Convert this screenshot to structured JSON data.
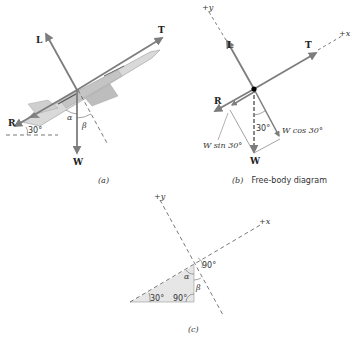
{
  "figure_a": {
    "caption": "(a)",
    "forces": {
      "lift": "L",
      "thrust": "T",
      "drag": "R",
      "weight": "W"
    },
    "angle_label": "30°",
    "alpha": "α",
    "beta": "β"
  },
  "figure_b": {
    "caption_prefix": "(b)",
    "caption_text": "Free-body diagram",
    "axis_y": "+y",
    "axis_x": "+x",
    "forces": {
      "lift": "L",
      "thrust": "T",
      "drag": "R",
      "weight": "W"
    },
    "component_sin": "W sin 30°",
    "component_cos": "W cos 30°",
    "angle_label": "30°"
  },
  "figure_c": {
    "caption": "(c)",
    "axis_y": "+y",
    "axis_x": "+x",
    "angle_30": "30°",
    "angle_90_bottom": "90°",
    "angle_90_top": "90°",
    "alpha": "α",
    "beta": "β"
  },
  "colors": {
    "arrow": "#8a8a8a",
    "dash": "#555555",
    "triangle_fill": "#e6e6e6",
    "text": "#222222"
  }
}
